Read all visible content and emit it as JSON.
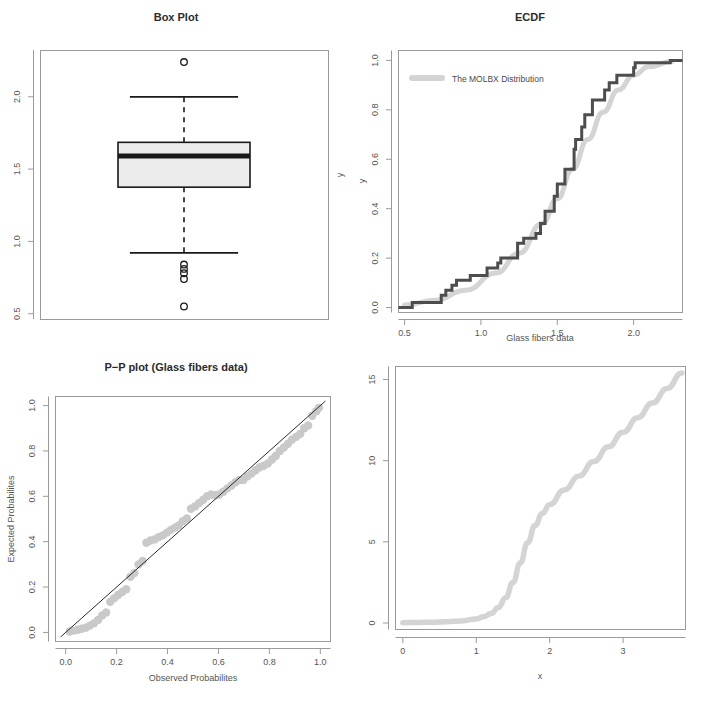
{
  "figure": {
    "background": "#ffffff",
    "panel_count": 4,
    "colors": {
      "ecdf_step": "#4d4d4d",
      "fitted_curve": "#d4d4d4",
      "point_fill": "#c9c9c9",
      "frame": "#9a9a9a",
      "text": "#3a3a3a",
      "box_fill": "#ececec",
      "box_stroke": "#1a1a1a"
    }
  },
  "chart_data": [
    {
      "type": "box",
      "panel": "top-left",
      "title": "Box Plot",
      "xlabel": "",
      "ylabel": "y",
      "ylim": [
        0.46,
        2.32
      ],
      "yticks": [
        "0.5",
        "1.0",
        "1.5",
        "2.0"
      ],
      "ytick_values": [
        0.5,
        1.0,
        1.5,
        2.0
      ],
      "grid": false,
      "box": {
        "lower_whisker": 0.92,
        "q1": 1.375,
        "median": 1.59,
        "q3": 1.685,
        "upper_whisker": 2.0,
        "outliers": [
          2.24,
          0.84,
          0.81,
          0.78,
          0.74,
          0.55
        ]
      }
    },
    {
      "type": "line",
      "panel": "top-right",
      "title": "ECDF",
      "xlabel": "Glass fibers data",
      "ylabel": "y",
      "xlim": [
        0.46,
        2.32
      ],
      "ylim": [
        -0.02,
        1.04
      ],
      "xticks": [
        "0.5",
        "1.0",
        "1.5",
        "2.0"
      ],
      "xtick_values": [
        0.5,
        1.0,
        1.5,
        2.0
      ],
      "yticks": [
        "0.0",
        "0.2",
        "0.4",
        "0.6",
        "0.8",
        "1.0"
      ],
      "ytick_values": [
        0.0,
        0.2,
        0.4,
        0.6,
        0.8,
        1.0
      ],
      "grid": false,
      "legend": {
        "position": "top-left",
        "entries": [
          {
            "label": "The MOLBX Distribution",
            "color": "#d4d4d4",
            "marker": "line"
          }
        ]
      },
      "series": [
        {
          "name": "Empirical CDF",
          "style": "step",
          "color": "#4d4d4d",
          "x": [
            0.55,
            0.74,
            0.77,
            0.81,
            0.84,
            0.93,
            1.04,
            1.11,
            1.13,
            1.24,
            1.28,
            1.36,
            1.39,
            1.42,
            1.48,
            1.5,
            1.55,
            1.61,
            1.62,
            1.66,
            1.68,
            1.73,
            1.81,
            1.84,
            1.89,
            2.0,
            2.01,
            2.24
          ],
          "y": [
            0.02,
            0.05,
            0.07,
            0.09,
            0.11,
            0.13,
            0.16,
            0.18,
            0.2,
            0.26,
            0.28,
            0.3,
            0.34,
            0.39,
            0.45,
            0.5,
            0.56,
            0.64,
            0.68,
            0.73,
            0.78,
            0.84,
            0.88,
            0.91,
            0.94,
            0.97,
            0.99,
            1.0
          ]
        },
        {
          "name": "The MOLBX Distribution",
          "style": "smooth",
          "color": "#d4d4d4",
          "x": [
            0.5,
            0.7,
            0.9,
            1.1,
            1.25,
            1.4,
            1.5,
            1.6,
            1.7,
            1.8,
            1.9,
            2.0,
            2.1,
            2.25
          ],
          "y": [
            0.01,
            0.03,
            0.07,
            0.14,
            0.22,
            0.34,
            0.44,
            0.56,
            0.68,
            0.79,
            0.88,
            0.94,
            0.975,
            0.995
          ]
        }
      ]
    },
    {
      "type": "scatter",
      "panel": "bottom-left",
      "title": "P−P plot (Glass fibers data)",
      "xlabel": "Observed Probabilites",
      "ylabel": "Expected Probabilites",
      "xlim": [
        -0.04,
        1.04
      ],
      "ylim": [
        -0.04,
        1.04
      ],
      "xticks": [
        "0.0",
        "0.2",
        "0.4",
        "0.6",
        "0.8",
        "1.0"
      ],
      "xtick_values": [
        0.0,
        0.2,
        0.4,
        0.6,
        0.8,
        1.0
      ],
      "yticks": [
        "0.0",
        "0.2",
        "0.4",
        "0.6",
        "0.8",
        "1.0"
      ],
      "ytick_values": [
        0.0,
        0.2,
        0.4,
        0.6,
        0.8,
        1.0
      ],
      "grid": false,
      "reference_line": {
        "type": "identity",
        "color": "#2b2b2b"
      },
      "point_color": "#c9c9c9",
      "points": [
        [
          0.016,
          0.004
        ],
        [
          0.032,
          0.008
        ],
        [
          0.048,
          0.012
        ],
        [
          0.063,
          0.016
        ],
        [
          0.079,
          0.021
        ],
        [
          0.095,
          0.03
        ],
        [
          0.111,
          0.04
        ],
        [
          0.127,
          0.055
        ],
        [
          0.143,
          0.075
        ],
        [
          0.159,
          0.088
        ],
        [
          0.175,
          0.135
        ],
        [
          0.19,
          0.15
        ],
        [
          0.206,
          0.165
        ],
        [
          0.222,
          0.178
        ],
        [
          0.238,
          0.19
        ],
        [
          0.254,
          0.245
        ],
        [
          0.27,
          0.262
        ],
        [
          0.286,
          0.3
        ],
        [
          0.302,
          0.315
        ],
        [
          0.317,
          0.395
        ],
        [
          0.333,
          0.405
        ],
        [
          0.349,
          0.41
        ],
        [
          0.365,
          0.42
        ],
        [
          0.381,
          0.428
        ],
        [
          0.397,
          0.44
        ],
        [
          0.413,
          0.452
        ],
        [
          0.429,
          0.462
        ],
        [
          0.444,
          0.472
        ],
        [
          0.46,
          0.49
        ],
        [
          0.476,
          0.502
        ],
        [
          0.492,
          0.545
        ],
        [
          0.508,
          0.555
        ],
        [
          0.524,
          0.57
        ],
        [
          0.54,
          0.585
        ],
        [
          0.556,
          0.6
        ],
        [
          0.571,
          0.608
        ],
        [
          0.587,
          0.605
        ],
        [
          0.603,
          0.608
        ],
        [
          0.619,
          0.62
        ],
        [
          0.635,
          0.635
        ],
        [
          0.651,
          0.648
        ],
        [
          0.667,
          0.662
        ],
        [
          0.683,
          0.672
        ],
        [
          0.698,
          0.672
        ],
        [
          0.714,
          0.688
        ],
        [
          0.73,
          0.7
        ],
        [
          0.746,
          0.715
        ],
        [
          0.762,
          0.728
        ],
        [
          0.778,
          0.735
        ],
        [
          0.794,
          0.745
        ],
        [
          0.81,
          0.762
        ],
        [
          0.825,
          0.778
        ],
        [
          0.841,
          0.8
        ],
        [
          0.857,
          0.815
        ],
        [
          0.873,
          0.832
        ],
        [
          0.889,
          0.85
        ],
        [
          0.905,
          0.862
        ],
        [
          0.921,
          0.875
        ],
        [
          0.937,
          0.9
        ],
        [
          0.952,
          0.912
        ],
        [
          0.968,
          0.955
        ],
        [
          0.984,
          0.975
        ],
        [
          0.995,
          0.99
        ]
      ]
    },
    {
      "type": "line",
      "panel": "bottom-right",
      "title": "",
      "xlabel": "x",
      "ylabel": "EHRF",
      "xlim": [
        -0.1,
        3.85
      ],
      "ylim": [
        -0.4,
        15.8
      ],
      "xticks": [
        "0",
        "1",
        "2",
        "3"
      ],
      "xtick_values": [
        0,
        1,
        2,
        3
      ],
      "yticks": [
        "0",
        "5",
        "10",
        "15"
      ],
      "ytick_values": [
        0,
        5,
        10,
        15
      ],
      "grid": false,
      "series": [
        {
          "name": "EHRF",
          "style": "smooth",
          "color": "#d4d4d4",
          "x": [
            0.0,
            0.2,
            0.4,
            0.6,
            0.8,
            1.0,
            1.1,
            1.2,
            1.3,
            1.4,
            1.5,
            1.6,
            1.7,
            1.8,
            1.9,
            2.0,
            2.2,
            2.4,
            2.6,
            2.8,
            3.0,
            3.2,
            3.4,
            3.6,
            3.8
          ],
          "y": [
            0.02,
            0.03,
            0.05,
            0.08,
            0.13,
            0.25,
            0.38,
            0.58,
            0.95,
            1.55,
            2.5,
            3.7,
            4.95,
            6.0,
            6.75,
            7.3,
            8.2,
            9.05,
            9.95,
            10.85,
            11.75,
            12.65,
            13.55,
            14.45,
            15.4
          ]
        }
      ]
    }
  ]
}
